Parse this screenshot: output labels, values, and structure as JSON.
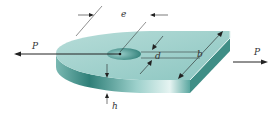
{
  "figure": {
    "type": "mechanics-diagram",
    "colors": {
      "top_face": "#9ccfcb",
      "side_face": "#5aa7a0",
      "side_dark": "#2f7f78",
      "highlight": "#e6f4f2",
      "hole": "#3f8e86",
      "lines": "#222222"
    }
  },
  "labels": {
    "load_left": "P",
    "load_right": "P",
    "edge_distance": "e",
    "hole_diameter": "d",
    "width": "b",
    "thickness": "h"
  }
}
